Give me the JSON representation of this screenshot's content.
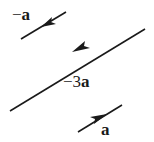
{
  "diagram": {
    "title": "",
    "colors": {
      "stroke": "#1a1a1a",
      "background": "#ffffff"
    },
    "vectors": [
      {
        "id": "neg-a",
        "label_sign": "−",
        "label_coef": "",
        "label_var": "a",
        "direction": "down-left",
        "length": "short"
      },
      {
        "id": "neg-3a",
        "label_sign": "−",
        "label_coef": "3",
        "label_var": "a",
        "direction": "down-left",
        "length": "long"
      },
      {
        "id": "a",
        "label_sign": "",
        "label_coef": "",
        "label_var": "a",
        "direction": "up-right",
        "length": "short"
      }
    ]
  }
}
